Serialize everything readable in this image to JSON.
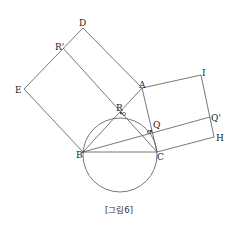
{
  "figure": {
    "caption": "[그림6]",
    "points": {
      "A": {
        "label": "A",
        "x": 142,
        "y": 88
      },
      "B": {
        "label": "B",
        "x": 83,
        "y": 152
      },
      "C": {
        "label": "C",
        "x": 157,
        "y": 152
      },
      "D": {
        "label": "D",
        "x": 83,
        "y": 28
      },
      "E": {
        "label": "E",
        "x": 24,
        "y": 89
      },
      "R": {
        "label": "R",
        "x": 121,
        "y": 113
      },
      "R_prime": {
        "label": "R'",
        "x": 63,
        "y": 48
      },
      "Q": {
        "label": "Q",
        "x": 151,
        "y": 131
      },
      "Q_prime": {
        "label": "Q'",
        "x": 210,
        "y": 117
      },
      "I": {
        "label": "I",
        "x": 201,
        "y": 75
      },
      "H": {
        "label": "H",
        "x": 214,
        "y": 137
      }
    },
    "circle": {
      "cx": 120,
      "cy": 155,
      "r": 37
    },
    "colors": {
      "stroke": "#555555",
      "text": "#222222"
    }
  }
}
